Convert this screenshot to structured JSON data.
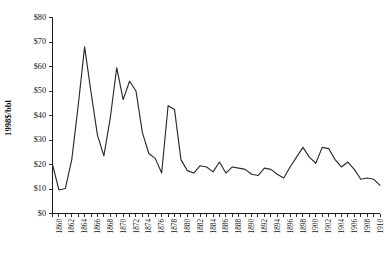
{
  "chart_data": {
    "type": "line",
    "title": "",
    "subtitle": "",
    "xlabel": "",
    "ylabel": "1998$/bbl",
    "xlim": [
      1859,
      1910
    ],
    "ylim": [
      0,
      80
    ],
    "grid": false,
    "legend": null,
    "y_tick_labels": [
      "$0",
      "$10",
      "$20",
      "$30",
      "$40",
      "$50",
      "$60",
      "$70",
      "$80"
    ],
    "y_tick_values": [
      0,
      10,
      20,
      30,
      40,
      50,
      60,
      70,
      80
    ],
    "x_tick_labels": [
      "1860",
      "1862",
      "1864",
      "1866",
      "1868",
      "1870",
      "1872",
      "1874",
      "1876",
      "1878",
      "1880",
      "1882",
      "1884",
      "1886",
      "1888",
      "1890",
      "1892",
      "1894",
      "1896",
      "1898",
      "1900",
      "1902",
      "1904",
      "1906",
      "1908",
      "1910"
    ],
    "x_tick_values": [
      1860,
      1862,
      1864,
      1866,
      1868,
      1870,
      1872,
      1874,
      1876,
      1878,
      1880,
      1882,
      1884,
      1886,
      1888,
      1890,
      1892,
      1894,
      1896,
      1898,
      1900,
      1902,
      1904,
      1906,
      1908,
      1910
    ],
    "x": [
      1859,
      1860,
      1861,
      1862,
      1863,
      1864,
      1865,
      1866,
      1867,
      1868,
      1869,
      1870,
      1871,
      1872,
      1873,
      1874,
      1875,
      1876,
      1877,
      1878,
      1879,
      1880,
      1881,
      1882,
      1883,
      1884,
      1885,
      1886,
      1887,
      1888,
      1889,
      1890,
      1891,
      1892,
      1893,
      1894,
      1895,
      1896,
      1897,
      1898,
      1899,
      1900,
      1901,
      1902,
      1903,
      1904,
      1905,
      1906,
      1907,
      1908,
      1909,
      1910
    ],
    "values": [
      20.0,
      9.6,
      10.2,
      22.0,
      44.0,
      68.0,
      49.5,
      32.0,
      23.5,
      39.0,
      59.5,
      46.5,
      54.0,
      50.0,
      33.0,
      24.5,
      22.5,
      16.5,
      44.0,
      42.5,
      22.0,
      17.5,
      16.5,
      19.5,
      19.0,
      17.0,
      21.0,
      16.5,
      19.0,
      18.5,
      18.0,
      16.0,
      15.5,
      18.5,
      18.0,
      16.0,
      14.5,
      19.0,
      23.0,
      27.0,
      23.0,
      20.5,
      27.0,
      26.5,
      22.0,
      19.0,
      21.0,
      18.0,
      14.0,
      14.5,
      14.0,
      11.5
    ],
    "series": [
      {
        "name": "Crude oil price (1998 dollars per barrel)",
        "color": "#2b2b2b",
        "values": [
          20.0,
          9.6,
          10.2,
          22.0,
          44.0,
          68.0,
          49.5,
          32.0,
          23.5,
          39.0,
          59.5,
          46.5,
          54.0,
          50.0,
          33.0,
          24.5,
          22.5,
          16.5,
          44.0,
          42.5,
          22.0,
          17.5,
          16.5,
          19.5,
          19.0,
          17.0,
          21.0,
          16.5,
          19.0,
          18.5,
          18.0,
          16.0,
          15.5,
          18.5,
          18.0,
          16.0,
          14.5,
          19.0,
          23.0,
          27.0,
          23.0,
          20.5,
          27.0,
          26.5,
          22.0,
          19.0,
          21.0,
          18.0,
          14.0,
          14.5,
          14.0,
          11.5
        ]
      }
    ],
    "annotations": []
  },
  "colors": {
    "line": "#2b2b2b",
    "axis": "#1a1a1a",
    "text": "#111111",
    "background": "#ffffff"
  }
}
